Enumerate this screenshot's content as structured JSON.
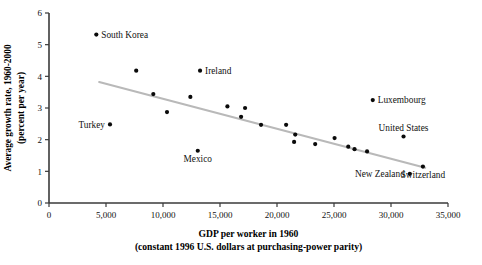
{
  "chart_data": {
    "type": "scatter",
    "title": "",
    "xlabel": "GDP per worker in 1960",
    "xlabel_sub": "(constant 1996 U.S. dollars at purchasing-power parity)",
    "ylabel_line1": "Average growth rate, 1960-2000",
    "ylabel_line2": "(percent per year)",
    "xlim": [
      0,
      35000
    ],
    "ylim": [
      0,
      6
    ],
    "xticks": [
      0,
      5000,
      10000,
      15000,
      20000,
      25000,
      30000,
      35000
    ],
    "xtick_labels": [
      "0",
      "5,000",
      "10,000",
      "15,000",
      "20,000",
      "25,000",
      "30,000",
      "35,000"
    ],
    "yticks": [
      0,
      1,
      2,
      3,
      4,
      5,
      6
    ],
    "ytick_labels": [
      "0",
      "1",
      "2",
      "3",
      "4",
      "5",
      "6"
    ],
    "grid": false,
    "legend": "none",
    "trendline": {
      "x1": 4400,
      "y1": 3.82,
      "x2": 33000,
      "y2": 1.11,
      "color": "#b9b9b9"
    },
    "points": [
      {
        "label": "South Korea",
        "x": 4150,
        "y": 5.32,
        "label_pos": "right"
      },
      {
        "label": "Turkey",
        "x": 5350,
        "y": 2.48,
        "label_pos": "left"
      },
      {
        "label": "",
        "x": 7650,
        "y": 4.18,
        "label_pos": "none"
      },
      {
        "label": "",
        "x": 9150,
        "y": 3.44,
        "label_pos": "none"
      },
      {
        "label": "",
        "x": 10350,
        "y": 2.87,
        "label_pos": "none"
      },
      {
        "label": "",
        "x": 12400,
        "y": 3.35,
        "label_pos": "none"
      },
      {
        "label": "Ireland",
        "x": 13250,
        "y": 4.18,
        "label_pos": "right"
      },
      {
        "label": "Mexico",
        "x": 13050,
        "y": 1.65,
        "label_pos": "below"
      },
      {
        "label": "",
        "x": 15650,
        "y": 3.05,
        "label_pos": "none"
      },
      {
        "label": "",
        "x": 17200,
        "y": 3.0,
        "label_pos": "none"
      },
      {
        "label": "",
        "x": 16850,
        "y": 2.72,
        "label_pos": "none"
      },
      {
        "label": "",
        "x": 18600,
        "y": 2.47,
        "label_pos": "none"
      },
      {
        "label": "",
        "x": 20800,
        "y": 2.47,
        "label_pos": "none"
      },
      {
        "label": "",
        "x": 21600,
        "y": 2.16,
        "label_pos": "none"
      },
      {
        "label": "",
        "x": 21500,
        "y": 1.93,
        "label_pos": "none"
      },
      {
        "label": "",
        "x": 23350,
        "y": 1.86,
        "label_pos": "none"
      },
      {
        "label": "",
        "x": 25050,
        "y": 2.05,
        "label_pos": "none"
      },
      {
        "label": "",
        "x": 26250,
        "y": 1.78,
        "label_pos": "none"
      },
      {
        "label": "",
        "x": 26800,
        "y": 1.7,
        "label_pos": "none"
      },
      {
        "label": "",
        "x": 27900,
        "y": 1.63,
        "label_pos": "none"
      },
      {
        "label": "Luxembourg",
        "x": 28400,
        "y": 3.25,
        "label_pos": "right"
      },
      {
        "label": "United States",
        "x": 31100,
        "y": 2.1,
        "label_pos": "above"
      },
      {
        "label": "New Zealand",
        "x": 31650,
        "y": 0.92,
        "label_pos": "left"
      },
      {
        "label": "Switzerland",
        "x": 32800,
        "y": 1.15,
        "label_pos": "below"
      }
    ]
  }
}
